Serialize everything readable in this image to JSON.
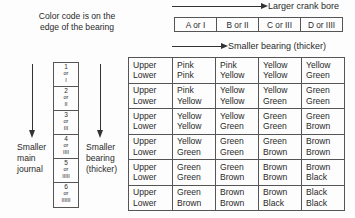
{
  "note": {
    "line1": "Color code is on the",
    "line2": "edge of the bearing"
  },
  "top_arrows": {
    "crank_bore": "Larger crank bore",
    "bearing": "Smaller bearing (thicker)"
  },
  "column_headers": [
    "A or I",
    "B or II",
    "C or III",
    "D or IIII"
  ],
  "left_labels": {
    "journal": [
      "Smaller",
      "main",
      "journal"
    ],
    "bearing": [
      "Smaller",
      "bearing",
      "(thicker)"
    ]
  },
  "row_codes": [
    {
      "num": "1",
      "or": "or",
      "roman": "I"
    },
    {
      "num": "2",
      "or": "or",
      "roman": "II"
    },
    {
      "num": "3",
      "or": "or",
      "roman": "III"
    },
    {
      "num": "4",
      "or": "or",
      "roman": "IIII"
    },
    {
      "num": "5",
      "or": "or",
      "roman": "IIIII"
    },
    {
      "num": "6",
      "or": "or",
      "roman": "IIIIII"
    }
  ],
  "row_label": {
    "upper": "Upper",
    "lower": "Lower"
  },
  "table": [
    [
      [
        "Pink",
        "Pink"
      ],
      [
        "Pink",
        "Yellow"
      ],
      [
        "Yellow",
        "Yellow"
      ],
      [
        "Yellow",
        "Green"
      ]
    ],
    [
      [
        "Pink",
        "Yellow"
      ],
      [
        "Yellow",
        "Yellow"
      ],
      [
        "Yellow",
        "Green"
      ],
      [
        "Green",
        "Green"
      ]
    ],
    [
      [
        "Yellow",
        "Yellow"
      ],
      [
        "Yellow",
        "Green"
      ],
      [
        "Green",
        "Green"
      ],
      [
        "Green",
        "Brown"
      ]
    ],
    [
      [
        "Yellow",
        "Green"
      ],
      [
        "Green",
        "Green"
      ],
      [
        "Green",
        "Brown"
      ],
      [
        "Brown",
        "Brown"
      ]
    ],
    [
      [
        "Green",
        "Green"
      ],
      [
        "Green",
        "Brown"
      ],
      [
        "Brown",
        "Brown"
      ],
      [
        "Brown",
        "Black"
      ]
    ],
    [
      [
        "Green",
        "Brown"
      ],
      [
        "Brown",
        "Brown"
      ],
      [
        "Brown",
        "Black"
      ],
      [
        "Black",
        "Black"
      ]
    ]
  ]
}
